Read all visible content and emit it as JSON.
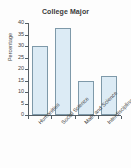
{
  "chart_data": {
    "type": "bar",
    "title": "College Major",
    "subtitle": "",
    "xlabel": "",
    "ylabel": "Percentage",
    "categories": [
      "Humanities",
      "Social Science",
      "Math and Science",
      "Interdisciplinary"
    ],
    "values": [
      30,
      38,
      15,
      17
    ],
    "ylim": [
      0,
      40
    ],
    "ytick_step": 5,
    "yticks": [
      0,
      5,
      10,
      15,
      20,
      25,
      30,
      35,
      40
    ],
    "ytick_labels": [
      "0",
      "5",
      "10",
      "15",
      "20",
      "25",
      "30",
      "35",
      "40"
    ],
    "grid": false,
    "legend": false,
    "legend_position": "none",
    "xtick_label_rotation": -45,
    "colors": {
      "bar_fill": "#dcebf5",
      "bar_border": "#7e99a9",
      "axis": "#555f66",
      "text": "#3f3f3f",
      "title": "#3a3a3a",
      "background": "#fdfdfd"
    }
  }
}
